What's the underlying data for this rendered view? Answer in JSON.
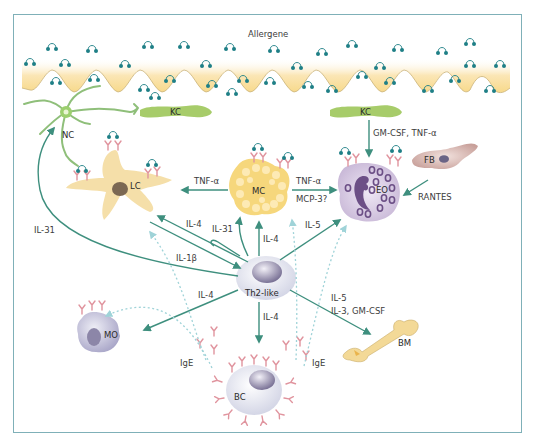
{
  "diagram": {
    "title": "Allergene",
    "colors": {
      "frame": "#7fb0b8",
      "arrow": "#3e8f7e",
      "dashed_arrow": "#9fd3d8",
      "allergen_dot": "#1e7f86",
      "skin": "#f7d98a",
      "keratinocyte": "#a7cc6a",
      "nerve": "#8fbf7a",
      "langerhans": "#f5dfa9",
      "mast_cell": "#f6d77c",
      "eosinophil": "#cdbfd9",
      "lymphocyte": "#dcdde8",
      "ige": "#e0949e",
      "bone": "#f3d997"
    },
    "cells": {
      "nc": "NC",
      "kc_left": "KC",
      "kc_right": "KC",
      "lc": "LC",
      "mc": "MC",
      "eo": "EO",
      "fb": "FB",
      "th2": "Th2-like",
      "mo": "MO",
      "bc": "BC",
      "bm": "BM"
    },
    "labels": {
      "kc_to_eo": "GM-CSF, TNF-α",
      "fb_to_eo": "RANTES",
      "mc_to_lc": "TNF-α",
      "mc_to_eo_1": "TNF-α",
      "mc_to_eo_2": "MCP-3?",
      "th2_to_nc": "IL-31",
      "th2_to_lc": "IL-4",
      "lc_to_th2": "IL-1β",
      "th2_to_mc_a": "IL-31",
      "th2_to_mc_b": "IL-4",
      "th2_to_eo": "IL-5",
      "th2_to_mo": "IL-4",
      "th2_to_bc": "IL-4",
      "th2_to_bm_1": "IL-5",
      "th2_to_bm_2": "IL-3, GM-CSF",
      "ige_left": "IgE",
      "ige_right": "IgE"
    }
  }
}
